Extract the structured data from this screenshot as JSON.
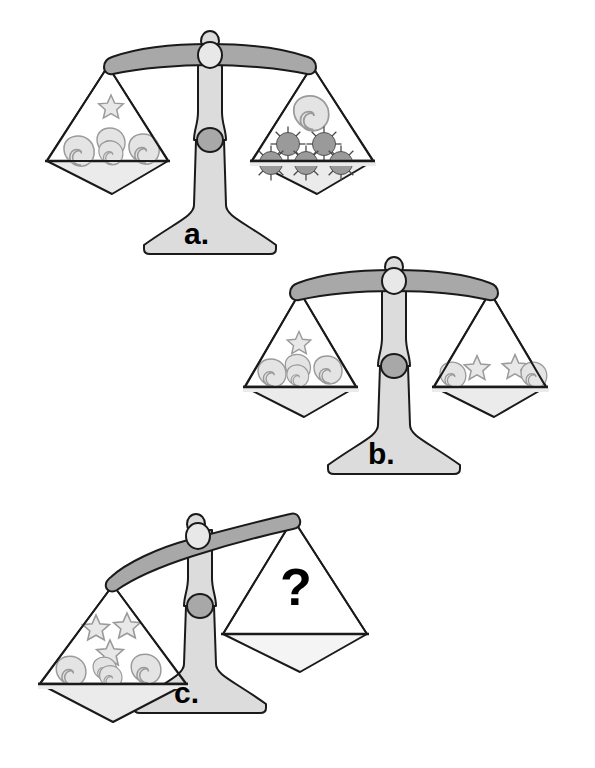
{
  "page": {
    "background_color": "#ffffff",
    "width": 595,
    "height": 768
  },
  "palette": {
    "outline": "#1a1a1a",
    "beam_fill": "#a8a8a8",
    "column_fill": "#dcdcdc",
    "base_fill": "#dcdcdc",
    "pan_fill": "#ffffff",
    "bowl_fill": "#ebebeb",
    "knob_fill": "#e8e8e8",
    "pivot_fill": "#a8a8a8",
    "moon_fill": "#e2e2e2",
    "moon_stroke": "#9a9a9a",
    "star_fill": "#e2e2e2",
    "star_stroke": "#9a9a9a",
    "sun_fill": "#9a9a9a",
    "sun_stroke": "#555555",
    "text_color": "#000000"
  },
  "icons": {
    "moon": "crescent-moon-icon",
    "star": "five-point-star-icon",
    "sun": "sun-icon",
    "question": "question-mark-icon"
  },
  "scales": [
    {
      "id": "a",
      "label": "a.",
      "state": "balanced",
      "tilt_degrees": 0,
      "center_x": 210,
      "beam_y": 52,
      "left_pan": {
        "name": "left-pan",
        "contents": [
          {
            "type": "star",
            "count": 1
          },
          {
            "type": "moon",
            "count": 4
          }
        ],
        "summary": "1 star and 4 moons"
      },
      "right_pan": {
        "name": "right-pan",
        "contents": [
          {
            "type": "moon",
            "count": 1
          },
          {
            "type": "sun",
            "count": 5
          }
        ],
        "summary": "1 moon and 5 suns"
      }
    },
    {
      "id": "b",
      "label": "b.",
      "state": "balanced",
      "tilt_degrees": 0,
      "center_x": 394,
      "beam_y": 278,
      "left_pan": {
        "name": "left-pan",
        "contents": [
          {
            "type": "star",
            "count": 1
          },
          {
            "type": "moon",
            "count": 4
          }
        ],
        "summary": "1 star and 4 moons"
      },
      "right_pan": {
        "name": "right-pan",
        "contents": [
          {
            "type": "star",
            "count": 2
          },
          {
            "type": "moon",
            "count": 2
          }
        ],
        "summary": "2 stars and 2 moons"
      }
    },
    {
      "id": "c",
      "label": "c.",
      "state": "tilted-left",
      "tilt_degrees": -17,
      "center_x": 200,
      "beam_y": 516,
      "left_pan": {
        "name": "left-pan",
        "contents": [
          {
            "type": "star",
            "count": 3
          },
          {
            "type": "moon",
            "count": 4
          }
        ],
        "summary": "3 stars and 4 moons"
      },
      "right_pan": {
        "name": "right-pan",
        "contents": [
          {
            "type": "question",
            "count": 1
          }
        ],
        "summary": "unknown — question mark"
      }
    }
  ],
  "question_mark": "?"
}
